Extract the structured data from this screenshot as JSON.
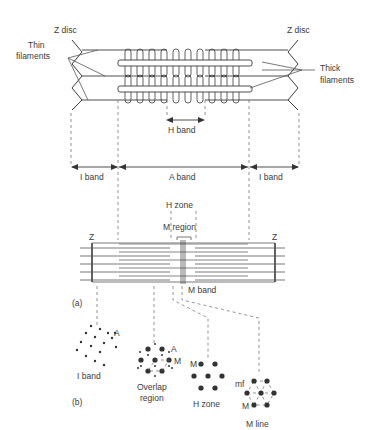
{
  "figure": {
    "panel_top": {
      "labels": {
        "z_disc_left": "Z disc",
        "z_disc_right": "Z disc",
        "thin_filaments_1": "Thin",
        "thin_filaments_2": "filaments",
        "thick_filaments_1": "Thick",
        "thick_filaments_2": "filaments",
        "h_band": "H band"
      },
      "band_labels": {
        "i_band_left": "I band",
        "a_band": "A band",
        "i_band_right": "I band"
      }
    },
    "panel_a": {
      "tag": "(a)",
      "labels": {
        "h_zone": "H zone",
        "m_region": "M region",
        "z_left": "Z",
        "z_right": "Z",
        "m_band": "M band"
      }
    },
    "panel_b": {
      "tag": "(b)",
      "sections": [
        {
          "name": "I band",
          "marker": "A"
        },
        {
          "name_line1": "Overlap",
          "name_line2": "region",
          "marker_a": "A",
          "marker_m": "M"
        },
        {
          "name": "H zone",
          "marker": "M"
        },
        {
          "name": "M line",
          "marker_mf": "mf",
          "marker_m": "M"
        }
      ]
    }
  }
}
